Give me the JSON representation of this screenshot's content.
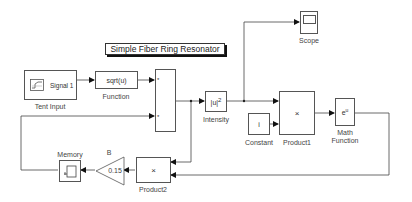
{
  "model": {
    "title": "Simple Fiber Ring Resonator"
  },
  "blocks": {
    "tent_input": {
      "label": "Tent Input",
      "signal": "Signal 1"
    },
    "function": {
      "label": "Function",
      "expr": "sqrt(u)"
    },
    "mux": {
      "port1": "*",
      "port2": "*"
    },
    "intensity": {
      "label": "Intensity",
      "expr": "|u|",
      "sup": "2"
    },
    "scope": {
      "label": "Scope"
    },
    "constant": {
      "label": "Constant",
      "value": "i"
    },
    "product1": {
      "label": "Product1",
      "symbol": "×"
    },
    "math_function": {
      "label_line1": "Math",
      "label_line2": "Function",
      "expr": "e",
      "sup": "u"
    },
    "product2": {
      "label": "Product2",
      "symbol": "×"
    },
    "gain": {
      "label": "B",
      "value": "0.15"
    },
    "memory": {
      "label": "Memory"
    }
  },
  "colors": {
    "line": "#333333",
    "block_border": "#555555",
    "background": "#ffffff"
  }
}
